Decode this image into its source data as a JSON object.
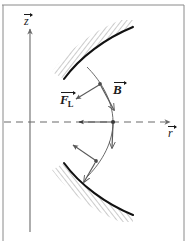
{
  "figure": {
    "type": "physics-diagram",
    "background_color": "#ffffff",
    "ink_color": "#1a1a1a",
    "frame": {
      "border_color": "#8a8a8a",
      "top": true,
      "left": true,
      "right": true,
      "bottom": false
    }
  },
  "axes": {
    "vertical": {
      "name": "z-axis",
      "label": "z",
      "vector_arrow": true,
      "direction": "up",
      "x": 30,
      "y_top": 28,
      "y_bottom": 232,
      "style": "solid",
      "color": "#6b6b6b"
    },
    "horizontal": {
      "name": "r-axis",
      "label": "r",
      "vector_arrow": true,
      "direction": "right",
      "y": 122,
      "x_left": 4,
      "x_right": 170,
      "style": "dashed",
      "color": "#6b6b6b"
    }
  },
  "pole_pieces": [
    {
      "name": "upper-pole-piece",
      "position": "top",
      "hatch_color": "#9a9a9a",
      "edge_color": "#111111",
      "edge_width": 2.0,
      "hatch_angle_deg": 35
    },
    {
      "name": "lower-pole-piece",
      "position": "bottom",
      "hatch_color": "#9a9a9a",
      "edge_color": "#111111",
      "edge_width": 2.0,
      "hatch_angle_deg": -35
    }
  ],
  "trajectory": {
    "name": "particle-path",
    "description": "bowed field line bulging toward +r, crossing r-axis at midpoint",
    "color": "#6b6b6b",
    "width": 0.9,
    "nodes": [
      {
        "label": "upper-node",
        "x": 100,
        "y": 84
      },
      {
        "label": "center-node",
        "x": 113,
        "y": 122
      },
      {
        "label": "lower-node",
        "x": 96,
        "y": 161
      }
    ]
  },
  "vectors": [
    {
      "name": "B-field-upper",
      "label": "B",
      "vector_arrow": true,
      "kind": "magnetic-field",
      "tangent_to": "trajectory",
      "direction": "down-right"
    },
    {
      "name": "B-field-lower",
      "label": "",
      "vector_arrow": false,
      "kind": "magnetic-field",
      "tangent_to": "trajectory",
      "direction": "down"
    },
    {
      "name": "lorentz-force-upper",
      "label": "F",
      "subscript": "L",
      "vector_arrow": true,
      "kind": "lorentz-force",
      "direction": "down-left"
    },
    {
      "name": "lorentz-force-center",
      "label": "",
      "vector_arrow": false,
      "kind": "lorentz-force",
      "direction": "left"
    },
    {
      "name": "lorentz-force-lower",
      "label": "",
      "vector_arrow": false,
      "kind": "lorentz-force",
      "direction": "up-left"
    }
  ],
  "labels": {
    "z": "z",
    "r": "r",
    "B": "B",
    "F": "F",
    "F_subscript": "L"
  }
}
